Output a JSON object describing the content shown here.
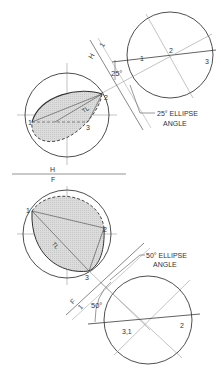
{
  "figure": {
    "type": "descriptive-geometry-ellipse-construction",
    "top_view": {
      "fold_line_label_H": "H",
      "fold_line_label_1": "1",
      "angle_text": "25°",
      "callout": {
        "line1": "25° ELLIPSE",
        "line2": "ANGLE"
      },
      "points": {
        "p1": "1",
        "p2": "2",
        "p3": "3",
        "p2_aux": "2",
        "p3_left": "3"
      },
      "tl_label": "TL"
    },
    "fold_hf": {
      "upper": "H",
      "lower": "F"
    },
    "bottom_view": {
      "fold_line_label_F": "F",
      "fold_line_label_1": "1",
      "angle_text": "50°",
      "callout": {
        "line1": "50° ELLIPSE",
        "line2": "ANGLE"
      },
      "points": {
        "p1": "1",
        "p2": "2",
        "p3": "3",
        "p31": "3,1",
        "p2_aux": "2"
      },
      "tl_label": "TL"
    },
    "colors": {
      "line": "#3a3a3a",
      "thin": "#9a9a9a",
      "shade": "#d8d8d8"
    }
  }
}
